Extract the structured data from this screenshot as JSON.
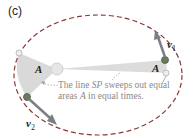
{
  "figure": {
    "panel_label": "(c)",
    "area_label_left": "A",
    "area_label_right": "A",
    "caption_line1_pre": "The line ",
    "caption_line1_italic": "SP",
    "caption_line1_post": " sweeps out equal",
    "caption_line2_pre": "areas ",
    "caption_line2_italic": "A",
    "caption_line2_post": " in equal times.",
    "velocity_1": {
      "symbol": "v",
      "subscript": "1"
    },
    "velocity_2": {
      "symbol": "v",
      "subscript": "2"
    },
    "colors": {
      "orbit": "#8b3a3a",
      "sector": "#d9d9d9",
      "sun": "#e6e6e6",
      "planet": "#6e7a60",
      "arrow": "#7a7f86",
      "caption": "#8a8a8a"
    }
  }
}
